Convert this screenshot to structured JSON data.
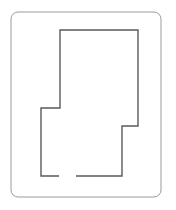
{
  "canvas": {
    "width": 176,
    "height": 210,
    "background_color": "#ffffff"
  },
  "figure": {
    "frame": {
      "name": "rounded-rectangle-frame",
      "x": 11,
      "y": 12,
      "width": 150,
      "height": 185,
      "corner_radius": 7,
      "stroke_color": "#9b9b9b",
      "stroke_width": 1,
      "fill": "none"
    },
    "outline": {
      "name": "floor-plan-polyline",
      "stroke_color": "#5a5a5a",
      "stroke_width": 1.4,
      "fill": "none",
      "open_gap": true,
      "gap_between_x": [
        59,
        76
      ],
      "gap_at_y": 176,
      "points": [
        [
          59,
          176
        ],
        [
          41,
          176
        ],
        [
          41,
          108
        ],
        [
          60,
          108
        ],
        [
          60,
          30
        ],
        [
          138,
          30
        ],
        [
          138,
          126
        ],
        [
          122,
          126
        ],
        [
          122,
          176
        ],
        [
          76,
          176
        ]
      ],
      "vertex_count": 10,
      "segments": [
        {
          "from": [
            59,
            176
          ],
          "to": [
            41,
            176
          ],
          "orientation": "horizontal",
          "length": 18
        },
        {
          "from": [
            41,
            176
          ],
          "to": [
            41,
            108
          ],
          "orientation": "vertical",
          "length": 68
        },
        {
          "from": [
            41,
            108
          ],
          "to": [
            60,
            108
          ],
          "orientation": "horizontal",
          "length": 19
        },
        {
          "from": [
            60,
            108
          ],
          "to": [
            60,
            30
          ],
          "orientation": "vertical",
          "length": 78
        },
        {
          "from": [
            60,
            30
          ],
          "to": [
            138,
            30
          ],
          "orientation": "horizontal",
          "length": 78
        },
        {
          "from": [
            138,
            30
          ],
          "to": [
            138,
            126
          ],
          "orientation": "vertical",
          "length": 96
        },
        {
          "from": [
            138,
            126
          ],
          "to": [
            122,
            126
          ],
          "orientation": "horizontal",
          "length": 16
        },
        {
          "from": [
            122,
            126
          ],
          "to": [
            122,
            176
          ],
          "orientation": "vertical",
          "length": 50
        },
        {
          "from": [
            122,
            176
          ],
          "to": [
            76,
            176
          ],
          "orientation": "horizontal",
          "length": 46
        }
      ]
    }
  }
}
